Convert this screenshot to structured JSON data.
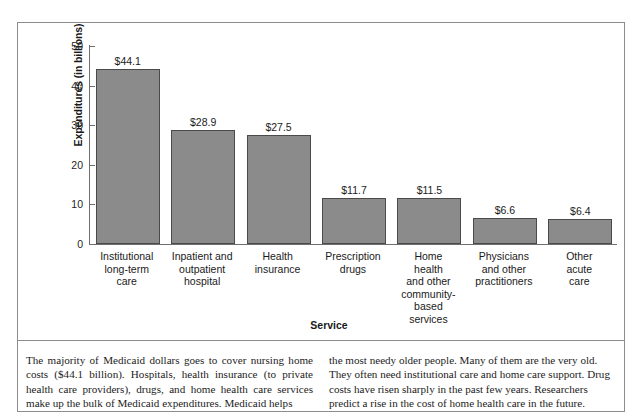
{
  "chart_data": {
    "type": "bar",
    "title": "",
    "xlabel": "Service",
    "ylabel": "Expenditures (in billions)",
    "ylim": [
      0,
      50
    ],
    "yticks": [
      0,
      10,
      20,
      30,
      40,
      50
    ],
    "ytick_labels": [
      "0",
      "10",
      "20",
      "30",
      "40",
      "50"
    ],
    "grid": false,
    "legend": null,
    "bar_color": "#8b8b8b",
    "bar_border_color": "#4a4a4a",
    "categories": [
      "Institutional long-term care",
      "Inpatient and outpatient hospital",
      "Health insurance",
      "Prescription drugs",
      "Home health and other community-based services",
      "Physicians and other practitioners",
      "Other acute care"
    ],
    "category_lines": [
      [
        "Institutional",
        "long-term",
        "care"
      ],
      [
        "Inpatient and",
        "outpatient",
        "hospital"
      ],
      [
        "Health",
        "insurance"
      ],
      [
        "Prescription",
        "drugs"
      ],
      [
        "Home",
        "health",
        "and other",
        "community-",
        "based",
        "services"
      ],
      [
        "Physicians",
        "and other",
        "practitioners"
      ],
      [
        "Other",
        "acute",
        "care"
      ]
    ],
    "values": [
      44.1,
      28.9,
      27.5,
      11.7,
      11.5,
      6.6,
      6.4
    ],
    "data_labels": [
      "$44.1",
      "$28.9",
      "$27.5",
      "$11.7",
      "$11.5",
      "$6.6",
      "$6.4"
    ]
  },
  "caption": {
    "left": "The majority of Medicaid dollars goes to cover nursing home costs ($44.1 billion). Hospitals, health insurance (to private health care providers), drugs, and home health care services make up the bulk of Medicaid expenditures. Medicaid helps",
    "right": "the most needy older people. Many of them are the very old. They often need institutional care and home care support. Drug costs have risen sharply in the past few years. Researchers predict a rise in the cost of home health care in the future."
  }
}
